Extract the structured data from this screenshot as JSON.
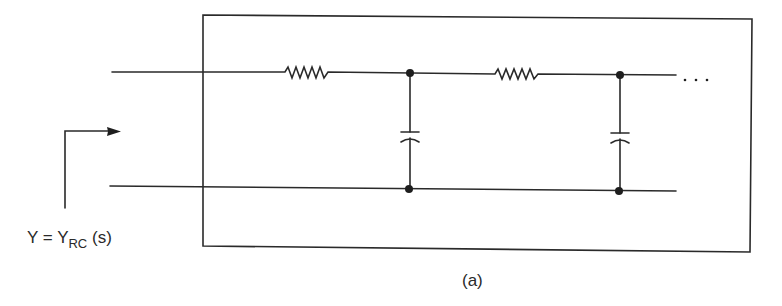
{
  "diagram": {
    "type": "RC ladder network (two-port)",
    "admittance_label": {
      "lhs": "Y",
      "equals": "=",
      "symbol": "Y",
      "subscript": "RC",
      "argument": "(s)"
    },
    "caption": "(a)",
    "continuation": "· · ·",
    "components": [
      {
        "kind": "resistor",
        "position": "series-1"
      },
      {
        "kind": "capacitor",
        "position": "shunt-1"
      },
      {
        "kind": "resistor",
        "position": "series-2"
      },
      {
        "kind": "capacitor",
        "position": "shunt-2"
      }
    ],
    "colors": {
      "line": "#2a2a2a",
      "background": "#ffffff"
    }
  }
}
